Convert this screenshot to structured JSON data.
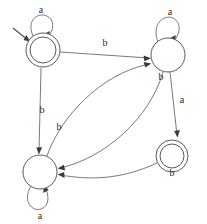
{
  "diagram": {
    "type": "state-transition-diagram",
    "alphabet": [
      "a",
      "b"
    ],
    "colors": {
      "background": "#ffffff",
      "state_stroke": "#5a5a5a",
      "edge_stroke": "#6a6a6a",
      "label_text": "#2b2b2b",
      "arrow_fill": "#3a3a3a"
    },
    "states": [
      {
        "id": "q0",
        "name": "top-left-state",
        "cx": 43,
        "cy": 50,
        "r": 17,
        "inner_r": 13,
        "accepting": true,
        "start": true
      },
      {
        "id": "q1",
        "name": "top-right-state",
        "cx": 168,
        "cy": 55,
        "r": 17,
        "inner_r": 0,
        "accepting": false,
        "start": false
      },
      {
        "id": "q2",
        "name": "bottom-left-state",
        "cx": 40,
        "cy": 172,
        "r": 17,
        "inner_r": 0,
        "accepting": false,
        "start": false
      },
      {
        "id": "q3",
        "name": "bottom-right-state",
        "cx": 172,
        "cy": 156,
        "r": 16,
        "inner_r": 12,
        "accepting": true,
        "start": false
      }
    ],
    "transitions": [
      {
        "from": "q0",
        "to": "q0",
        "symbol": "a",
        "kind": "self-loop",
        "label_x": 41,
        "label_y": 11
      },
      {
        "from": "q1",
        "to": "q1",
        "symbol": "a",
        "kind": "self-loop",
        "label_x": 170,
        "label_y": 12
      },
      {
        "from": "q2",
        "to": "q2",
        "symbol": "a",
        "kind": "self-loop",
        "label_x": 40,
        "label_y": 217
      },
      {
        "from": "q0",
        "to": "q1",
        "symbol": "b",
        "kind": "straight",
        "label_x": 105,
        "label_y": 44
      },
      {
        "from": "q0",
        "to": "q2",
        "symbol": "b",
        "kind": "straight",
        "label_x": 42,
        "label_y": 111
      },
      {
        "from": "q2",
        "to": "q1",
        "symbol": "b",
        "kind": "curve",
        "label_x": 59,
        "label_y": 128
      },
      {
        "from": "q1",
        "to": "q2",
        "symbol": "b",
        "kind": "curve",
        "label_x": 161,
        "label_y": 77
      },
      {
        "from": "q1",
        "to": "q3",
        "symbol": "a",
        "kind": "straight",
        "label_x": 181,
        "label_y": 100
      },
      {
        "from": "q3",
        "to": "q2",
        "symbol": "b",
        "kind": "curve",
        "label_x": 172,
        "label_y": 173
      }
    ],
    "labels": {
      "a_top_left": "a",
      "a_top_right": "a",
      "a_bottom_left": "a",
      "b_top_edge": "b",
      "b_left_edge": "b",
      "b_lower_curve": "b",
      "b_right_state": "b",
      "a_right_edge": "a",
      "b_bottom_right": "b"
    }
  }
}
